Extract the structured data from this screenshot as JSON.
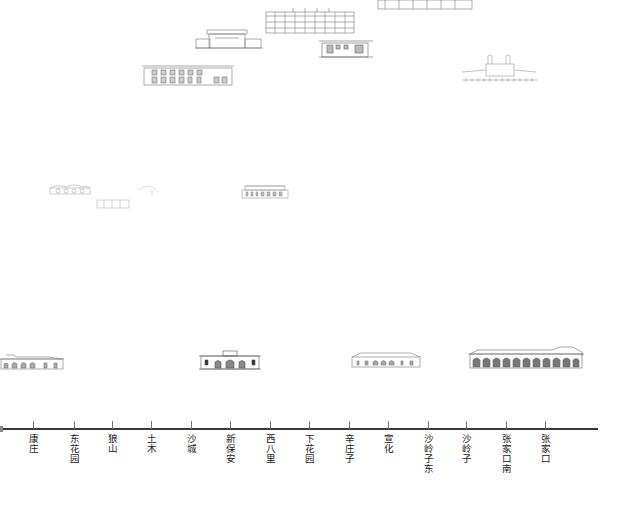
{
  "diagram": {
    "type": "railway-station-elevation-timeline",
    "axis": {
      "orientation": "horizontal",
      "line_color": "#3a3a3a"
    },
    "stations": [
      {
        "name": "康庄",
        "x": 33
      },
      {
        "name": "东花园",
        "x": 74
      },
      {
        "name": "狼山",
        "x": 112
      },
      {
        "name": "土木",
        "x": 151
      },
      {
        "name": "沙城",
        "x": 191
      },
      {
        "name": "新保安",
        "x": 230
      },
      {
        "name": "西八里",
        "x": 270
      },
      {
        "name": "下花园",
        "x": 309
      },
      {
        "name": "辛庄子",
        "x": 349
      },
      {
        "name": "宣化",
        "x": 388
      },
      {
        "name": "沙岭子东",
        "x": 428
      },
      {
        "name": "沙岭子",
        "x": 466
      },
      {
        "name": "张家口南",
        "x": 506
      },
      {
        "name": "张家口",
        "x": 545
      }
    ],
    "drawings": [
      {
        "id": "elev-top-center-tall",
        "tier": "top"
      },
      {
        "id": "elev-top-pavilion",
        "tier": "top"
      },
      {
        "id": "elev-top-right-box",
        "tier": "top"
      },
      {
        "id": "elev-top-long-left",
        "tier": "top"
      },
      {
        "id": "elev-top-far-right-strip",
        "tier": "top"
      },
      {
        "id": "elev-top-far-right-bridge",
        "tier": "top"
      },
      {
        "id": "elev-mid-small-arches",
        "tier": "middle"
      },
      {
        "id": "elev-mid-small-box",
        "tier": "middle"
      },
      {
        "id": "elev-mid-sketch",
        "tier": "middle"
      },
      {
        "id": "elev-mid-centre",
        "tier": "middle"
      },
      {
        "id": "elev-bottom-kangzhuang",
        "tier": "bottom"
      },
      {
        "id": "elev-bottom-xinbaoan",
        "tier": "bottom"
      },
      {
        "id": "elev-bottom-xinzhuangzi",
        "tier": "bottom"
      },
      {
        "id": "elev-bottom-zhangjiakounan",
        "tier": "bottom"
      }
    ]
  }
}
